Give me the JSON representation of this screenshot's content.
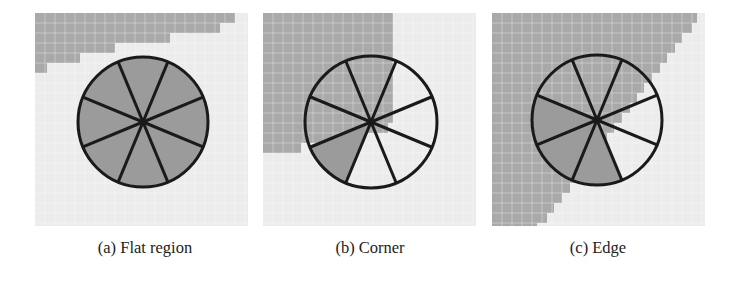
{
  "figure": {
    "panels": [
      {
        "id": "a",
        "label": "(a) Flat region",
        "x": 35,
        "caption_center_x": 145,
        "circle": {
          "cx": 108,
          "cy": 109,
          "r": 65
        },
        "shaded_sectors": [
          0,
          1,
          2,
          3,
          4,
          5,
          6,
          7
        ],
        "region_rows": [
          200,
          185,
          135,
          80,
          45,
          12
        ]
      },
      {
        "id": "b",
        "label": "(b) Corner",
        "x": 263,
        "caption_center_x": 370,
        "circle": {
          "cx": 108,
          "cy": 109,
          "r": 66
        },
        "shaded_sectors": [
          7
        ],
        "region_rows": [
          130,
          130,
          130,
          130,
          130,
          130,
          130,
          130,
          130,
          130,
          130,
          125,
          100,
          38
        ]
      },
      {
        "id": "c",
        "label": "(c) Edge",
        "x": 492,
        "caption_center_x": 598,
        "circle": {
          "cx": 105,
          "cy": 107,
          "r": 65
        },
        "shaded_sectors": [
          6,
          7,
          0
        ],
        "region_rows": [
          205,
          200,
          190,
          183,
          175,
          168,
          160,
          152,
          145,
          138,
          130,
          122,
          115,
          108,
          100,
          92,
          85,
          78,
          70,
          62,
          55,
          45
        ]
      }
    ],
    "colors": {
      "dark_region": "#a9a9a9",
      "dark_grid": "#bcbcbc",
      "light_region": "#ececec",
      "light_grid": "#f5f5f5",
      "sector_fill": "#9b9b9b",
      "stroke": "#1a1a1a"
    },
    "grid_cell": 10
  }
}
